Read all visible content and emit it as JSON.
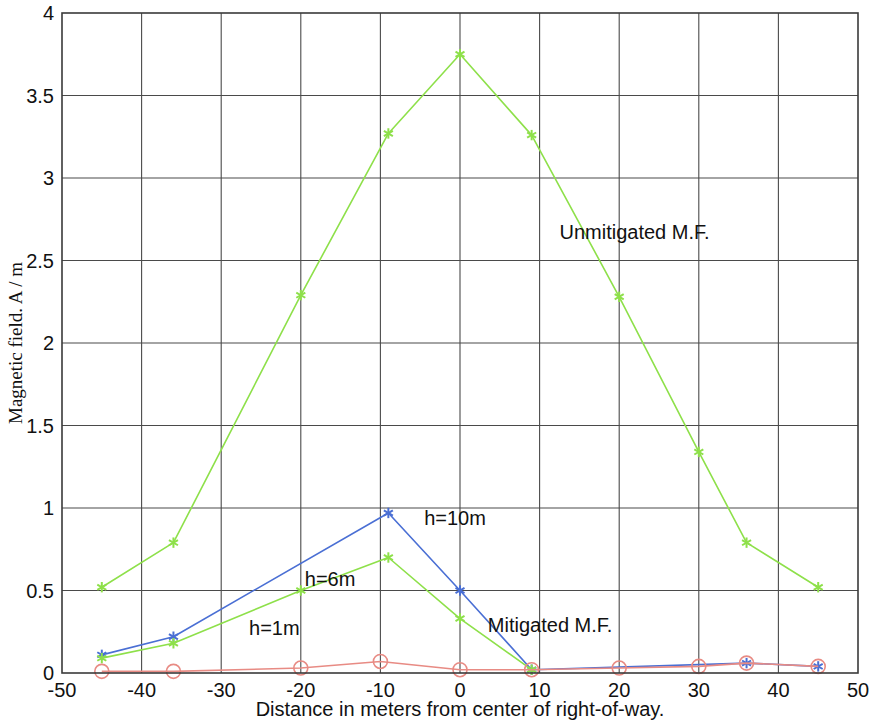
{
  "chart_data": {
    "type": "line",
    "title": "",
    "xlabel": "Distance in meters from center of right-of-way.",
    "ylabel": "Magnetic field. A / m",
    "xlim": [
      -50,
      50
    ],
    "ylim": [
      0,
      4
    ],
    "xticks": [
      -50,
      -40,
      -30,
      -20,
      -10,
      0,
      10,
      20,
      30,
      40,
      50
    ],
    "xtick_labels": [
      "-50",
      "-40",
      "-30",
      "-20",
      "-10",
      "0",
      "10",
      "20",
      "30",
      "40",
      "50"
    ],
    "yticks": [
      0,
      0.5,
      1,
      1.5,
      2,
      2.5,
      3,
      3.5,
      4
    ],
    "ytick_labels": [
      "0",
      "0.5",
      "1",
      "1.5",
      "2",
      "2.5",
      "3",
      "3.5",
      "4"
    ],
    "grid": true,
    "legend_position": "none",
    "series": [
      {
        "name": "Unmitigated M.F.",
        "color": "#8ee04a",
        "marker": "star",
        "x": [
          -45,
          -36,
          -20,
          -9,
          0,
          9,
          20,
          30,
          36,
          45
        ],
        "values": [
          0.52,
          0.79,
          2.29,
          3.27,
          3.75,
          3.26,
          2.28,
          1.34,
          0.79,
          0.52
        ]
      },
      {
        "name": "h=10m",
        "color": "#4a6fd4",
        "marker": "star",
        "x": [
          -45,
          -36,
          -9,
          0,
          9,
          36,
          45
        ],
        "values": [
          0.11,
          0.22,
          0.97,
          0.5,
          0.02,
          0.06,
          0.04
        ]
      },
      {
        "name": "h=6m",
        "color": "#8ee04a",
        "marker": "star",
        "x": [
          -45,
          -36,
          -20,
          -9,
          0,
          9
        ],
        "values": [
          0.09,
          0.18,
          0.5,
          0.7,
          0.33,
          0.02
        ]
      },
      {
        "name": "h=1m",
        "color": "#e88b84",
        "marker": "circle",
        "x": [
          -45,
          -36,
          -20,
          -10,
          0,
          9,
          20,
          30,
          36,
          45
        ],
        "values": [
          0.01,
          0.01,
          0.03,
          0.07,
          0.02,
          0.02,
          0.03,
          0.04,
          0.06,
          0.04
        ]
      }
    ],
    "annotations": [
      {
        "text": "Unmitigated M.F.",
        "x": 12.5,
        "y": 2.63
      },
      {
        "text": "h=10m",
        "x": -4.5,
        "y": 0.9
      },
      {
        "text": "h=6m",
        "x": -19.5,
        "y": 0.53
      },
      {
        "text": "h=1m",
        "x": -26.5,
        "y": 0.23
      },
      {
        "text": "Mitigated M.F.",
        "x": 3.5,
        "y": 0.25
      }
    ],
    "colors": {
      "axis": "#3a3a3a",
      "grid": "#4a4a4a",
      "unmitigated": "#8ee04a",
      "h10m": "#4a6fd4",
      "h6m": "#8ee04a",
      "h1m": "#e88b84",
      "text": "#111111",
      "background": "#ffffff"
    }
  }
}
